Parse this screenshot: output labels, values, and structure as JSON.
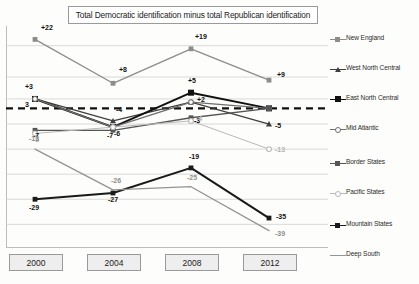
{
  "chart_data": {
    "type": "line",
    "title": "Total Democratic identification minus total Republican identification",
    "xlabel": "",
    "ylabel": "",
    "categories": [
      "2000",
      "2004",
      "2008",
      "2012"
    ],
    "x": [
      2000,
      2004,
      2008,
      2012
    ],
    "ylim": [
      -42,
      25
    ],
    "grid": true,
    "legend_position": "right",
    "zero_reference_line": 0,
    "series": [
      {
        "name": "New England",
        "color": "#8c8c8c",
        "marker": "square-filled",
        "values": [
          22,
          8,
          19,
          9
        ],
        "labels": [
          "+22",
          "+8",
          "+19",
          "+9"
        ]
      },
      {
        "name": "West North Central",
        "color": "#3f3f3f",
        "marker": "triangle-filled",
        "values": [
          3,
          -4,
          2,
          -5
        ],
        "labels": [
          "+3",
          "-4",
          "+2",
          "-5"
        ]
      },
      {
        "name": "East North Central",
        "color": "#111111",
        "marker": "square-filled-bold",
        "values": [
          3,
          -6,
          5,
          0
        ],
        "labels": [
          "3",
          "-6",
          "+5",
          ""
        ]
      },
      {
        "name": "Mid Atlantic",
        "color": "#6e6e6e",
        "marker": "circle-open",
        "values": [
          3,
          -6,
          2,
          0
        ],
        "labels": [
          "",
          "",
          "",
          ""
        ]
      },
      {
        "name": "Border States",
        "color": "#555555",
        "marker": "square-filled",
        "values": [
          -7,
          -7,
          -3,
          0
        ],
        "labels": [
          "-7",
          "-7",
          "-3",
          ""
        ]
      },
      {
        "name": "Pacific States",
        "color": "#b8b8b8",
        "marker": "circle-open",
        "values": [
          -8,
          -6,
          -4,
          -13
        ],
        "labels": [
          "-8",
          "",
          "-4",
          "-13"
        ]
      },
      {
        "name": "Mountain States",
        "color": "#1a1a1a",
        "marker": "square-filled",
        "values": [
          -29,
          -27,
          -19,
          -35
        ],
        "labels": [
          "-29",
          "-27",
          "-19",
          "-35"
        ]
      },
      {
        "name": "Deep South",
        "color": "#949494",
        "marker": "none",
        "values": [
          -13,
          -26,
          -25,
          -39
        ],
        "labels": [
          "-13",
          "-26",
          "-25",
          "-39"
        ]
      }
    ]
  },
  "title": {
    "text": "Total Democratic identification minus total Republican identification"
  },
  "axis": {
    "ticks": [
      {
        "label": "2000"
      },
      {
        "label": "2004"
      },
      {
        "label": "2008"
      },
      {
        "label": "2012"
      }
    ]
  },
  "legend": {
    "items": [
      {
        "label": "New England"
      },
      {
        "label": "West North Central"
      },
      {
        "label": "East North Central"
      },
      {
        "label": "Mid Atlantic"
      },
      {
        "label": "Border States"
      },
      {
        "label": "Pacific States"
      },
      {
        "label": "Mountain States"
      },
      {
        "label": "Deep South"
      }
    ]
  }
}
